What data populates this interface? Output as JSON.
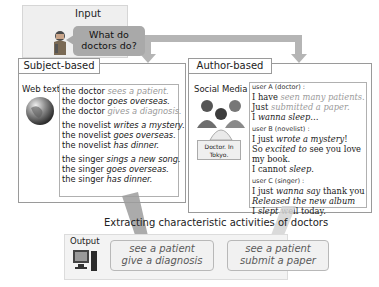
{
  "input": {
    "label": "Input",
    "question_line1": "What do",
    "question_line2": "doctors do?"
  },
  "subject_panel": {
    "title": "Subject-based",
    "source_label": "Web text",
    "icon": "globe-icon",
    "groups": [
      [
        {
          "subject": "the doctor ",
          "action": "sees a patient.",
          "highlight": true
        },
        {
          "subject": "the doctor ",
          "action": "goes overseas.",
          "highlight": false
        },
        {
          "subject": "the doctor ",
          "action": "gives a diagnosis.",
          "highlight": true
        }
      ],
      [
        {
          "subject": "the novelist ",
          "action": "writes a mystery.",
          "highlight": false
        },
        {
          "subject": "the novelist ",
          "action": "goes overseas.",
          "highlight": false
        },
        {
          "subject": "the novelist ",
          "action": "has dinner.",
          "highlight": false
        }
      ],
      [
        {
          "subject": "the singer ",
          "action": "sings a new song.",
          "highlight": false
        },
        {
          "subject": "the singer ",
          "action": "goes overseas.",
          "highlight": false
        },
        {
          "subject": "the singer ",
          "action": "has dinner.",
          "highlight": false
        }
      ]
    ]
  },
  "author_panel": {
    "title": "Author-based",
    "source_label": "Social Media",
    "icon": "people-icon",
    "profile_tag_line1": "Doctor. In",
    "profile_tag_line2": "Tokyo.",
    "users": [
      {
        "label": "user A (doctor) :",
        "lines": [
          [
            {
              "t": "I have ",
              "s": "n"
            },
            {
              "t": "seen many patients.",
              "s": "g"
            }
          ],
          [
            {
              "t": "Just ",
              "s": "n"
            },
            {
              "t": "submitted a paper.",
              "s": "g"
            }
          ],
          [
            {
              "t": "I ",
              "s": "n"
            },
            {
              "t": "wanna sleep",
              "s": "i"
            },
            {
              "t": "…",
              "s": "n"
            }
          ]
        ]
      },
      {
        "label": "user B (novelist) :",
        "lines": [
          [
            {
              "t": "I just ",
              "s": "n"
            },
            {
              "t": "wrote a mystery",
              "s": "i"
            },
            {
              "t": "!",
              "s": "n"
            }
          ],
          [
            {
              "t": "So ",
              "s": "n"
            },
            {
              "t": "excited to",
              "s": "i"
            },
            {
              "t": " see you love",
              "s": "n"
            }
          ],
          [
            {
              "t": "my book.",
              "s": "n"
            }
          ],
          [
            {
              "t": "I cannot ",
              "s": "n"
            },
            {
              "t": "sleep",
              "s": "i"
            },
            {
              "t": ".",
              "s": "n"
            }
          ]
        ]
      },
      {
        "label": "user C (singer) :",
        "lines": [
          [
            {
              "t": "I just ",
              "s": "n"
            },
            {
              "t": "wanna say",
              "s": "i"
            },
            {
              "t": " thank you",
              "s": "n"
            }
          ],
          [
            {
              "t": "Released the new album",
              "s": "i"
            }
          ],
          [
            {
              "t": "I ",
              "s": "n"
            },
            {
              "t": "slept",
              "s": "i"
            },
            {
              "t": " well today.",
              "s": "n"
            }
          ]
        ]
      }
    ]
  },
  "extract_caption": "Extracting characteristic activities of doctors",
  "output": {
    "label": "Output",
    "icon": "computer-icon",
    "results": [
      {
        "line1": "see a patient",
        "line2": "give a diagnosis"
      },
      {
        "line1": "see a patient",
        "line2": "submit a paper"
      }
    ]
  },
  "colors": {
    "arrow": "#b5b5b5",
    "speech_bubble": "#a9a9a9",
    "panel_border": "#9a9a9a",
    "highlight_text": "#9a9a9a"
  }
}
